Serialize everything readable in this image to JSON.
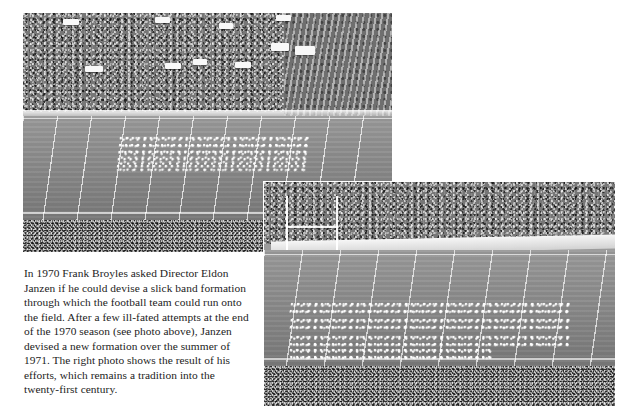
{
  "page": {
    "background_color": "#ffffff",
    "width": 633,
    "height": 417,
    "document_type": "book page scan"
  },
  "caption": {
    "text": "In 1970 Frank Broyles asked Director Eldon Janzen if he could devise a slick band formation through which the football team could run onto the field. After a few ill-fated attempts at the end of the 1970 season (see photo above), Janzen devised a new formation over the summer of 1971. The right photo shows the result of his efforts, which remains a tradition into the twenty-first century.",
    "lines": [
      "In 1970 Frank Broyles asked Director Eldon",
      "Janzen if he could devise a slick band formation",
      "through which the football team could run onto",
      "the field. After a few ill-fated attempts at the end",
      "of the 1970 season (see photo above), Janzen",
      "devised a new formation over the summer of",
      "1971. The right photo shows the result of his",
      "efforts, which remains a tradition into the",
      "twenty-first century."
    ],
    "text_color": "#1c1c1c"
  },
  "photos": [
    {
      "id": "top-photo",
      "name": "top-stadium-photo",
      "description": "Black and white aerial photograph of a packed football stadium; marching band in a wide formation on the field, spectators filling the grandstand, a crowd standing along the near sideline.",
      "position": {
        "left": 23,
        "top": 13,
        "width": 369,
        "height": 239
      },
      "tone": "grayscale",
      "elements": [
        "grandstand crowd",
        "white awnings",
        "football field with yard lines",
        "marching band formation",
        "sideline crowd"
      ]
    },
    {
      "id": "right-photo",
      "name": "right-stadium-photo",
      "description": "Black and white photograph of the stadium showing the marching band forming a tunnel formation on the field near the goalpost, with the grandstand crowd behind.",
      "position": {
        "left": 263,
        "top": 181,
        "width": 351,
        "height": 224
      },
      "tone": "grayscale",
      "elements": [
        "grandstand crowd",
        "white retaining wall",
        "goalpost",
        "band tunnel formation",
        "football field with yard lines",
        "foreground crowd"
      ],
      "has_white_border": true
    }
  ]
}
